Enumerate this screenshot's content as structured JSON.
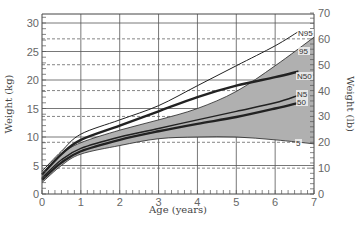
{
  "chart_data": {
    "type": "line",
    "title": "",
    "xlabel": "Age (years)",
    "ylabel": "Weight (kg)",
    "y2label": "Weight (lb)",
    "xlim": [
      0,
      7
    ],
    "ylim": [
      0,
      31
    ],
    "y2lim": [
      0,
      70
    ],
    "x_ticks": [
      "0",
      "1",
      "2",
      "3",
      "4",
      "5",
      "6",
      "7"
    ],
    "y_ticks": [
      "0",
      "5",
      "10",
      "15",
      "20",
      "25",
      "30"
    ],
    "y2_ticks": [
      "0",
      "10",
      "20",
      "30",
      "40",
      "50",
      "60",
      "70"
    ],
    "grid": true,
    "shaded_band": {
      "upper": "95",
      "lower": "5",
      "color": "#b0b0b0"
    },
    "series": [
      {
        "name": "N95",
        "style": "thin",
        "x": [
          0,
          0.5,
          1,
          2,
          3,
          4,
          5,
          6,
          6.6
        ],
        "values": [
          4,
          7.5,
          10.5,
          13,
          15.5,
          19,
          22.5,
          26,
          28.5
        ]
      },
      {
        "name": "95",
        "style": "band-edge",
        "x": [
          0,
          0.5,
          1,
          2,
          3,
          4,
          5,
          6,
          7
        ],
        "values": [
          3.5,
          7,
          9,
          11.2,
          13,
          15,
          18,
          22.5,
          27.5
        ]
      },
      {
        "name": "N50",
        "style": "thick",
        "x": [
          0,
          0.5,
          1,
          2,
          3,
          4,
          5,
          6,
          6.6
        ],
        "values": [
          3.4,
          7,
          9.5,
          12,
          14.5,
          17,
          19,
          20.5,
          21.5
        ]
      },
      {
        "name": "N5",
        "style": "medium",
        "x": [
          0,
          0.5,
          1,
          2,
          3,
          4,
          5,
          6,
          6.6
        ],
        "values": [
          2.8,
          6,
          8,
          10,
          11.5,
          13,
          14.5,
          16,
          17.3
        ]
      },
      {
        "name": "50",
        "style": "thick",
        "x": [
          0,
          0.5,
          1,
          2,
          3,
          4,
          5,
          6,
          6.6
        ],
        "values": [
          2.5,
          5.5,
          7.5,
          9.5,
          11,
          12.3,
          13.5,
          15,
          16
        ]
      },
      {
        "name": "5",
        "style": "band-edge",
        "x": [
          0,
          0.5,
          1,
          2,
          3,
          4,
          5,
          6,
          7
        ],
        "values": [
          2,
          5,
          7,
          8.5,
          9.7,
          10,
          10,
          9.5,
          8.8
        ]
      }
    ],
    "labels": {
      "n95": "N95",
      "p95": "95",
      "n50": "N50",
      "n5": "N5",
      "p50": "50",
      "p5": "5"
    }
  }
}
